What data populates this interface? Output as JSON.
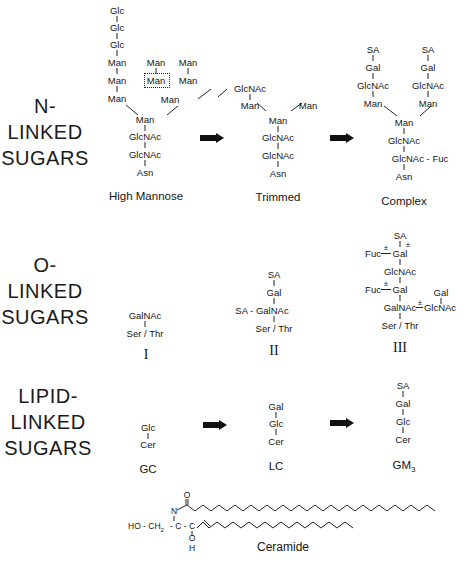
{
  "sections": {
    "n_linked": {
      "line1": "N-",
      "line2": "LINKED",
      "line3": "SUGARS"
    },
    "o_linked": {
      "line1": "O-",
      "line2": "LINKED",
      "line3": "SUGARS"
    },
    "lipid_linked": {
      "line1": "LIPID-",
      "line2": "LINKED",
      "line3": "SUGARS"
    }
  },
  "n_linked": {
    "high_mannose": {
      "caption": "High Mannose",
      "residues": {
        "glc1": "Glc",
        "glc2": "Glc",
        "glc3": "Glc",
        "man_l1": "Man",
        "man_l2": "Man",
        "man_l3": "Man",
        "man_m1": "Man",
        "man_m2": "Man",
        "man_r1": "Man",
        "man_r2": "Man",
        "man_branch": "Man",
        "man_core": "Man",
        "glcnac1": "GlcNAc",
        "glcnac2": "GlcNAc",
        "asn": "Asn"
      }
    },
    "trimmed": {
      "caption": "Trimmed",
      "residues": {
        "glcnac_top": "GlcNAc",
        "man_l": "Man",
        "man_r": "Man",
        "man_core": "Man",
        "glcnac1": "GlcNAc",
        "glcnac2": "GlcNAc",
        "asn": "Asn"
      }
    },
    "complex": {
      "caption": "Complex",
      "residues": {
        "sa_l": "SA",
        "gal_l": "Gal",
        "glcnac_l": "GlcNAc",
        "man_l": "Man",
        "sa_r": "SA",
        "gal_r": "Gal",
        "glcnac_r": "GlcNAc",
        "man_r": "Man",
        "man_core": "Man",
        "glcnac1": "GlcNAc",
        "glcnac2": "GlcNAc - Fuc",
        "asn": "Asn"
      }
    }
  },
  "o_linked": {
    "type_I": {
      "numeral": "I",
      "residues": {
        "galnac": "GalNAc",
        "ser_thr": "Ser / Thr"
      }
    },
    "type_II": {
      "numeral": "II",
      "residues": {
        "sa": "SA",
        "gal": "Gal",
        "galnac": "SA - GalNAc",
        "ser_thr": "Ser / Thr"
      }
    },
    "type_III": {
      "numeral": "III",
      "residues": {
        "sa": "SA",
        "pm_sa": "±",
        "fuc1": "Fuc",
        "pm1": "±",
        "gal1": "Gal",
        "glcnac": "GlcNAc",
        "fuc2": "Fuc",
        "pm2": "±",
        "gal2": "Gal",
        "gal3": "Gal",
        "galnac": "GalNAc",
        "pm3": "±",
        "glcnac2": "GlcNAc",
        "ser_thr": "Ser / Thr"
      }
    }
  },
  "lipid_linked": {
    "gc": {
      "caption": "GC",
      "residues": {
        "glc": "Glc",
        "cer": "Cer"
      }
    },
    "lc": {
      "caption": "LC",
      "residues": {
        "gal": "Gal",
        "glc": "Glc",
        "cer": "Cer"
      }
    },
    "gm3": {
      "caption": "GM",
      "caption_sub": "3",
      "residues": {
        "sa": "SA",
        "gal": "Gal",
        "glc": "Glc",
        "cer": "Cer"
      }
    }
  },
  "ceramide": {
    "caption": "Ceramide",
    "labels": {
      "o_top": "O",
      "n": "N",
      "ho_ch2": "HO - CH",
      "ch2_sub": "2",
      "c1": "- C -",
      "c2": "C",
      "o_bottom": "O",
      "h": "H"
    }
  },
  "arrows": [
    "n-trimmed-arrow",
    "n-complex-arrow",
    "lipid-lc-arrow",
    "lipid-gm3-arrow"
  ]
}
